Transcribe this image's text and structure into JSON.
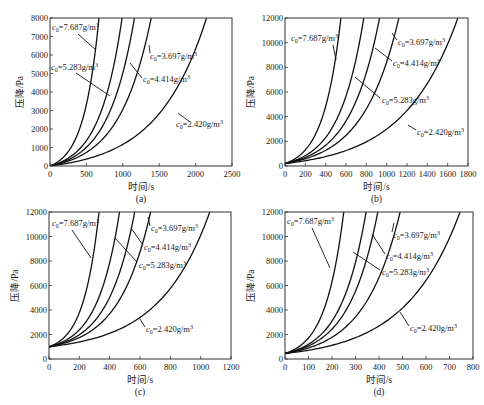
{
  "figure": {
    "panel_labels": [
      "(a)",
      "(b)",
      "(c)",
      "(d)"
    ]
  },
  "chart_data": [
    {
      "type": "line",
      "panel": "(a)",
      "xlabel": "时间/s",
      "ylabel": "压降/Pa",
      "xlim": [
        0,
        2500
      ],
      "ylim": [
        0,
        8000
      ],
      "xticks": [
        0,
        500,
        1000,
        1500,
        2000,
        2500
      ],
      "yticks": [
        0,
        1000,
        2000,
        3000,
        4000,
        5000,
        6000,
        7000,
        8000
      ],
      "frame": {
        "left": 50,
        "right": 232,
        "top": 18,
        "bottom": 166
      },
      "y0": 0,
      "grid": false,
      "series": [
        {
          "name": "c0=7.687g/m3",
          "t_end": 673
        },
        {
          "name": "c0=5.283g/m3",
          "t_end": 990
        },
        {
          "name": "c0=4.414g/m3",
          "t_end": 1160
        },
        {
          "name": "c0=3.697g/m3",
          "t_end": 1390
        },
        {
          "name": "c0=2.420g/m3",
          "t_end": 2150
        }
      ],
      "annotations": [
        {
          "text": "c0=7.687g/m3",
          "x": 52,
          "y": 30,
          "lx1": 78,
          "ly1": 34,
          "lx2": 96,
          "ly2": 50
        },
        {
          "text": "c0=5.283g/m3",
          "x": 51,
          "y": 70,
          "lx1": 76,
          "ly1": 73,
          "lx2": 110,
          "ly2": 96
        },
        {
          "text": "c0=4.414g/m3",
          "x": 143,
          "y": 82,
          "lx1": 142,
          "ly1": 78,
          "lx2": 130,
          "ly2": 63
        },
        {
          "text": "c0=3.697g/m3",
          "x": 150,
          "y": 59,
          "lx1": 150,
          "ly1": 53,
          "lx2": 149,
          "ly2": 45
        },
        {
          "text": "c0=2.420g/m3",
          "x": 176,
          "y": 127,
          "lx1": 190,
          "ly1": 122,
          "lx2": 178,
          "ly2": 113
        }
      ]
    },
    {
      "type": "line",
      "panel": "(b)",
      "xlabel": "时间/s",
      "ylabel": "压降/Pa",
      "xlim": [
        0,
        1800
      ],
      "ylim": [
        0,
        12000
      ],
      "xticks": [
        0,
        200,
        400,
        600,
        800,
        1000,
        1200,
        1400,
        1600,
        1800
      ],
      "yticks": [
        0,
        2000,
        4000,
        6000,
        8000,
        10000,
        12000
      ],
      "frame": {
        "left": 285,
        "right": 468,
        "top": 18,
        "bottom": 166
      },
      "y0": 200,
      "grid": false,
      "series": [
        {
          "name": "c0=7.687g/m3",
          "t_end": 550
        },
        {
          "name": "c0=5.283g/m3",
          "t_end": 775
        },
        {
          "name": "c0=4.414g/m3",
          "t_end": 930
        },
        {
          "name": "c0=3.697g/m3",
          "t_end": 1120
        },
        {
          "name": "c0=2.420g/m3",
          "t_end": 1700
        }
      ],
      "annotations": [
        {
          "text": "c0=7.687g/m3",
          "x": 291,
          "y": 41,
          "lx1": 333,
          "ly1": 45,
          "lx2": 336,
          "ly2": 60
        },
        {
          "text": "c0=3.697g/m3",
          "x": 398,
          "y": 45,
          "lx1": 397,
          "ly1": 40,
          "lx2": 392,
          "ly2": 33
        },
        {
          "text": "c0=4.414g/m3",
          "x": 393,
          "y": 66,
          "lx1": 392,
          "ly1": 61,
          "lx2": 375,
          "ly2": 48
        },
        {
          "text": "c0=5.283g/m3",
          "x": 382,
          "y": 103,
          "lx1": 380,
          "ly1": 98,
          "lx2": 355,
          "ly2": 77
        },
        {
          "text": "c0=2.420g/m3",
          "x": 417,
          "y": 135,
          "lx1": 416,
          "ly1": 130,
          "lx2": 408,
          "ly2": 125
        }
      ]
    },
    {
      "type": "line",
      "panel": "(c)",
      "xlabel": "时间/s",
      "ylabel": "压降/Pa",
      "xlim": [
        0,
        1200
      ],
      "ylim": [
        0,
        12000
      ],
      "xticks": [
        0,
        200,
        400,
        600,
        800,
        1000,
        1200
      ],
      "yticks": [
        0,
        2000,
        4000,
        6000,
        8000,
        10000,
        12000
      ],
      "frame": {
        "left": 49,
        "right": 231,
        "top": 212,
        "bottom": 359
      },
      "y0": 1000,
      "grid": false,
      "series": [
        {
          "name": "c0=7.687g/m3",
          "t_end": 330
        },
        {
          "name": "c0=5.283g/m3",
          "t_end": 465
        },
        {
          "name": "c0=4.414g/m3",
          "t_end": 565
        },
        {
          "name": "c0=3.697g/m3",
          "t_end": 670
        },
        {
          "name": "c0=2.420g/m3",
          "t_end": 1060
        }
      ],
      "annotations": [
        {
          "text": "c0=7.687g/m3",
          "x": 52,
          "y": 226,
          "lx1": 72,
          "ly1": 230,
          "lx2": 91,
          "ly2": 258
        },
        {
          "text": "c0=3.697g/m3",
          "x": 151,
          "y": 231,
          "lx1": 150,
          "ly1": 226,
          "lx2": 148,
          "ly2": 217
        },
        {
          "text": "c0=4.414g/m3",
          "x": 144,
          "y": 250,
          "lx1": 143,
          "ly1": 245,
          "lx2": 131,
          "ly2": 228
        },
        {
          "text": "c0=5.283g/m3",
          "x": 139,
          "y": 268,
          "lx1": 137,
          "ly1": 262,
          "lx2": 115,
          "ly2": 238
        },
        {
          "text": "c0=2.420g/m3",
          "x": 146,
          "y": 332,
          "lx1": 145,
          "ly1": 327,
          "lx2": 140,
          "ly2": 319
        }
      ]
    },
    {
      "type": "line",
      "panel": "(d)",
      "xlabel": "时间/s",
      "ylabel": "压降/Pa",
      "xlim": [
        0,
        800
      ],
      "ylim": [
        0,
        12000
      ],
      "xticks": [
        0,
        100,
        200,
        300,
        400,
        500,
        600,
        700,
        800
      ],
      "yticks": [
        0,
        2000,
        4000,
        6000,
        8000,
        10000,
        12000
      ],
      "frame": {
        "left": 285,
        "right": 473,
        "top": 212,
        "bottom": 359
      },
      "y0": 450,
      "grid": false,
      "series": [
        {
          "name": "c0=7.687g/m3",
          "t_end": 250
        },
        {
          "name": "c0=5.283g/m3",
          "t_end": 345
        },
        {
          "name": "c0=4.414g/m3",
          "t_end": 395
        },
        {
          "name": "c0=3.697g/m3",
          "t_end": 490
        },
        {
          "name": "c0=2.420g/m3",
          "t_end": 745
        }
      ],
      "annotations": [
        {
          "text": "c0=7.687g/m3",
          "x": 287,
          "y": 224,
          "lx1": 312,
          "ly1": 228,
          "lx2": 330,
          "ly2": 268
        },
        {
          "text": "c0=3.697g/m3",
          "x": 393,
          "y": 238,
          "lx1": 392,
          "ly1": 232,
          "lx2": 394,
          "ly2": 223
        },
        {
          "text": "c0=4.414g/m3",
          "x": 386,
          "y": 259,
          "lx1": 385,
          "ly1": 254,
          "lx2": 372,
          "ly2": 234
        },
        {
          "text": "c0=5.283g/m3",
          "x": 382,
          "y": 275,
          "lx1": 380,
          "ly1": 270,
          "lx2": 353,
          "ly2": 252
        },
        {
          "text": "c0=2.420g/m3",
          "x": 410,
          "y": 331,
          "lx1": 409,
          "ly1": 326,
          "lx2": 400,
          "ly2": 312
        }
      ]
    }
  ]
}
